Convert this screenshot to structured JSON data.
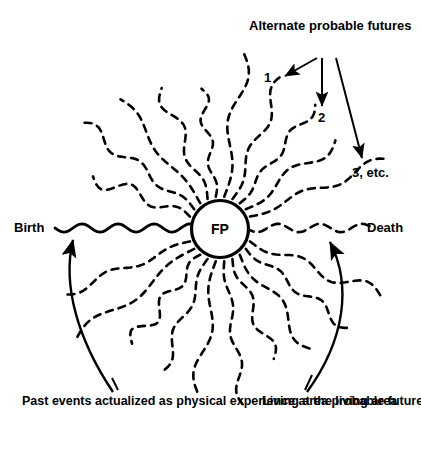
{
  "figure": {
    "center_node": {
      "label": "FP",
      "cx": 220,
      "cy": 229,
      "r": 28.5
    },
    "annotations": {
      "alternate_futures": "Alternate probable futures",
      "future_1": "1",
      "future_2": "2",
      "future_3": "3, etc.",
      "birth": "Birth",
      "death": "Death"
    },
    "captions": {
      "past_events": "Past events actualized as physical experience at the living area",
      "living_area": "Living area probable future"
    },
    "colors": {
      "ink": "#000000",
      "background": "#ffffff"
    },
    "rays": {
      "count": 24,
      "style": "wavy-dashed",
      "description": "probable future lines radiating from focus point"
    }
  },
  "chart_data": {
    "type": "diagram",
    "nodes": [
      {
        "id": "FP",
        "label": "FP",
        "x": 220,
        "y": 229,
        "shape": "circle"
      }
    ],
    "edges": [
      {
        "from": "alternate-futures-caption",
        "to": "future-1",
        "style": "solid-arrow"
      },
      {
        "from": "alternate-futures-caption",
        "to": "future-2",
        "style": "solid-arrow"
      },
      {
        "from": "alternate-futures-caption",
        "to": "future-3",
        "style": "solid-arrow"
      },
      {
        "from": "past-events-caption",
        "to": "birth-line",
        "style": "curved-arrow"
      },
      {
        "from": "living-area-caption",
        "to": "death-line",
        "style": "curved-arrow"
      }
    ],
    "annotations": [
      "Alternate probable futures",
      "1",
      "2",
      "3, etc.",
      "Birth",
      "Death",
      "Past events actualized as physical experience at the living area",
      "Living area probable future"
    ]
  }
}
